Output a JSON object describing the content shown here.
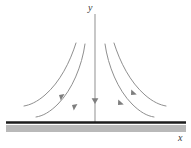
{
  "figure": {
    "kind": "slope-field-sketch",
    "background_color": "#ffffff",
    "axes": {
      "y_axis": {
        "label": "y",
        "color": "#9a9a9a",
        "x_position": 95,
        "top": 14,
        "bottom": 122,
        "stroke_width": 1.1
      },
      "x_axis": {
        "label": "x",
        "color": "#1c1c1c",
        "y_position": 122,
        "left": 6,
        "right": 186,
        "stroke_width": 2.6,
        "shadow_band": {
          "color": "#b9b9b9",
          "top": 125,
          "height": 7
        }
      }
    },
    "curve_color": "#8f8f8f",
    "curve_stroke_width": 1.0,
    "arrow_color": "#7e7e7e",
    "curves": [
      {
        "name": "left-outer-curve",
        "side": "left",
        "top_x": 76,
        "top_y": 43,
        "end_x": 24,
        "end_y": 106,
        "arrow_x": 59,
        "arrow_y": 95
      },
      {
        "name": "left-inner-curve",
        "side": "left",
        "top_x": 85,
        "top_y": 44,
        "end_x": 36,
        "end_y": 117,
        "arrow_x": 72,
        "arrow_y": 105
      },
      {
        "name": "right-inner-curve",
        "side": "right",
        "top_x": 105,
        "top_y": 44,
        "end_x": 154,
        "end_y": 117,
        "arrow_x": 118,
        "arrow_y": 105
      },
      {
        "name": "right-outer-curve",
        "side": "right",
        "top_x": 114,
        "top_y": 43,
        "end_x": 166,
        "end_y": 106,
        "arrow_x": 131,
        "arrow_y": 95
      }
    ],
    "axis_arrow": {
      "name": "y-axis-flow-arrow",
      "x": 95,
      "y": 101,
      "direction": "down"
    }
  }
}
